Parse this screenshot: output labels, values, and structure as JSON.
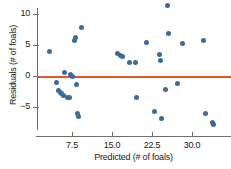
{
  "chart_data": {
    "type": "scatter",
    "title": "",
    "xlabel": "Predicted (# of foals)",
    "ylabel": "Residuals (# of foals)",
    "xlim": [
      2.0,
      35.5
    ],
    "ylim": [
      -9.5,
      12.0
    ],
    "xticks": [
      7.5,
      15.0,
      22.5,
      30.0
    ],
    "xtick_labels": [
      "7.5",
      "15.0",
      "22.5",
      "30.0"
    ],
    "yticks": [
      10,
      5,
      0,
      -5
    ],
    "ytick_labels": [
      "10",
      "5",
      "0",
      "−5"
    ],
    "grid": false,
    "legend": null,
    "reference_line": {
      "orientation": "horizontal",
      "y": 0,
      "color": "#e8552b"
    },
    "point_color": "#3d6b96",
    "points": [
      {
        "x": 3.2,
        "y": 3.9
      },
      {
        "x": 4.6,
        "y": -1.1
      },
      {
        "x": 5.0,
        "y": -2.3
      },
      {
        "x": 5.3,
        "y": -2.6
      },
      {
        "x": 5.6,
        "y": -2.9
      },
      {
        "x": 5.9,
        "y": -3.2
      },
      {
        "x": 6.1,
        "y": 0.6
      },
      {
        "x": 6.6,
        "y": -3.5
      },
      {
        "x": 7.1,
        "y": -3.4
      },
      {
        "x": 7.3,
        "y": 0.3
      },
      {
        "x": 7.6,
        "y": 0.0
      },
      {
        "x": 7.9,
        "y": 5.7
      },
      {
        "x": 8.1,
        "y": 6.2
      },
      {
        "x": 8.4,
        "y": -1.3
      },
      {
        "x": 8.6,
        "y": -6.1
      },
      {
        "x": 8.8,
        "y": -6.6
      },
      {
        "x": 9.2,
        "y": 7.9
      },
      {
        "x": 16.0,
        "y": 3.6
      },
      {
        "x": 16.5,
        "y": 3.3
      },
      {
        "x": 17.0,
        "y": 3.1
      },
      {
        "x": 18.2,
        "y": 2.1
      },
      {
        "x": 19.4,
        "y": 2.1
      },
      {
        "x": 19.6,
        "y": -3.4
      },
      {
        "x": 21.4,
        "y": 5.4
      },
      {
        "x": 22.9,
        "y": -5.8
      },
      {
        "x": 23.9,
        "y": 3.5
      },
      {
        "x": 24.0,
        "y": 2.5
      },
      {
        "x": 24.3,
        "y": -6.8
      },
      {
        "x": 25.4,
        "y": 11.3
      },
      {
        "x": 25.6,
        "y": 6.8
      },
      {
        "x": 25.0,
        "y": -2.2
      },
      {
        "x": 27.3,
        "y": -1.2
      },
      {
        "x": 28.2,
        "y": 5.2
      },
      {
        "x": 32.2,
        "y": 5.7
      },
      {
        "x": 32.6,
        "y": -6.1
      },
      {
        "x": 33.8,
        "y": -7.5
      },
      {
        "x": 34.1,
        "y": -7.9
      }
    ]
  }
}
